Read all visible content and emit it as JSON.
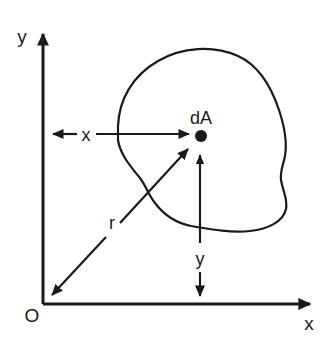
{
  "figure": {
    "background_color": "#ffffff",
    "ink_color": "#1a1a1a",
    "width": 334,
    "height": 354
  },
  "axes": {
    "y_axis_label": "y",
    "x_axis_label": "x",
    "origin_label": "O",
    "origin": {
      "x": 43,
      "y": 304
    },
    "y_axis_tip": {
      "x": 43,
      "y": 30
    },
    "x_axis_tip": {
      "x": 314,
      "y": 304
    },
    "y_label_pos": {
      "x": 22,
      "y": 43
    },
    "x_label_pos": {
      "x": 309,
      "y": 330
    },
    "origin_label_pos": {
      "x": 32,
      "y": 322
    }
  },
  "point": {
    "label": "dA",
    "label_pos": {
      "x": 201,
      "y": 124
    },
    "marker_center": {
      "x": 201,
      "y": 136
    },
    "marker_radius": 6
  },
  "dimensions": [
    {
      "name": "x-distance",
      "label": "x",
      "label_pos": {
        "x": 86,
        "y": 141
      },
      "from": {
        "x": 45,
        "y": 134
      },
      "to": {
        "x": 197,
        "y": 134
      },
      "gap_start": 77,
      "gap_end": 96,
      "arrow_start": true,
      "arrow_end": true,
      "orientation": "horizontal"
    },
    {
      "name": "y-distance",
      "label": "y",
      "label_pos": {
        "x": 200,
        "y": 265
      },
      "from": {
        "x": 200,
        "y": 146
      },
      "to": {
        "x": 200,
        "y": 302
      },
      "gap_start": 243,
      "gap_end": 272,
      "arrow_start": true,
      "arrow_end": true,
      "orientation": "vertical"
    },
    {
      "name": "r-distance",
      "label": "r",
      "label_pos": {
        "x": 112,
        "y": 229
      },
      "from": {
        "x": 46,
        "y": 301
      },
      "to": {
        "x": 194,
        "y": 143
      },
      "arrow_start": true,
      "arrow_end": true,
      "orientation": "diagonal"
    }
  ],
  "shape": {
    "name": "irregular-area-outline",
    "path": "M 118 126 C 119 100 132 76 158 61 C 182 47 213 45 238 56 C 258 65 271 86 279 110 C 285 128 287 144 285 156 C 283 166 280 171 281 180 C 283 192 288 199 286 209 C 283 222 268 229 250 231 C 230 233 209 229 191 226 C 176 223 164 215 155 203 C 148 194 146 186 140 178 C 130 166 120 154 118 140 Z"
  }
}
